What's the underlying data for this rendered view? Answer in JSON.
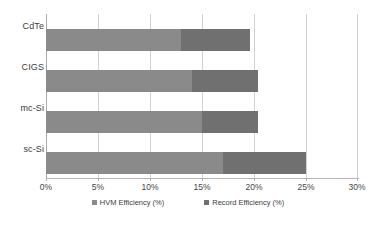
{
  "chart_data": {
    "type": "bar",
    "orientation": "horizontal",
    "stacked": true,
    "title": "",
    "xlabel": "",
    "ylabel": "",
    "categories": [
      "CdTe",
      "CIGS",
      "mc-Si",
      "sc-Si"
    ],
    "series": [
      {
        "name": "HVM Efficiency (%)",
        "color": "#8a8a8a",
        "values": [
          13.0,
          14.0,
          15.0,
          17.0
        ]
      },
      {
        "name": "Record Efficiency (%)",
        "color": "#707070",
        "values": [
          19.6,
          20.4,
          20.4,
          25.0
        ]
      }
    ],
    "xlim": [
      0,
      30
    ],
    "xticks": [
      0,
      5,
      10,
      15,
      20,
      25,
      30
    ],
    "xtick_labels": [
      "0%",
      "5%",
      "10%",
      "15%",
      "20%",
      "25%",
      "30%"
    ],
    "grid": true,
    "legend_position": "bottom"
  },
  "legend": {
    "items": [
      {
        "label": "HVM Efficiency  (%)",
        "color": "#8a8a8a"
      },
      {
        "label": "Record Efficiency  (%)",
        "color": "#707070"
      }
    ]
  }
}
